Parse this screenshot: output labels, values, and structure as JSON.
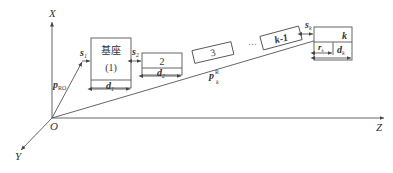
{
  "axes": {
    "x_label": "X",
    "y_label": "Y",
    "z_label": "Z",
    "origin_label": "O"
  },
  "vectors": {
    "p_ro": {
      "main": "p",
      "sub": "RO"
    },
    "p_k": {
      "main": "p",
      "sup": "R",
      "sub": "k"
    }
  },
  "blocks": {
    "base": {
      "title": "基座",
      "index": "(1)",
      "width_label": {
        "main": "d",
        "sub": "1"
      },
      "gap_label": {
        "main": "s",
        "sub": "1"
      }
    },
    "block2": {
      "index": "2",
      "width_label": {
        "main": "d",
        "sub": "2"
      },
      "gap_label": {
        "main": "s",
        "sub": "2"
      }
    },
    "block3": {
      "index": "3"
    },
    "ellipsis": "···",
    "block_k_minus_1": {
      "index": "k-1"
    },
    "block_k": {
      "index": "k",
      "gap_label": {
        "main": "s",
        "sub": "k"
      },
      "r_label": {
        "main": "r",
        "sub": "k"
      },
      "width_label": {
        "main": "d",
        "sub": "k"
      }
    }
  },
  "colors": {
    "stroke": "#555555",
    "text": "#333333",
    "background": "#ffffff"
  }
}
